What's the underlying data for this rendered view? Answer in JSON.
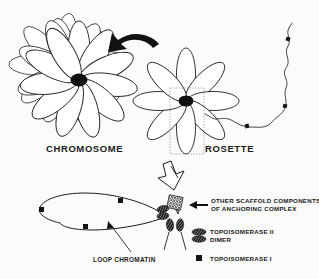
{
  "figure": {
    "title_context": "Chromatin loop organization diagram",
    "background_color": "#fbfbfb",
    "ink_color": "#1a1a1a"
  },
  "labels": {
    "chromosome": "CHROMOSOME",
    "rosette": "ROSETTE",
    "loop_chromatin": "LOOP CHROMATIN",
    "scaffold_line1": "OTHER SCAFFOLD COMPONENTS",
    "scaffold_line2": "OF ANCHORING COMPLEX"
  },
  "legend": {
    "items": [
      {
        "symbol": "hatched-ellipse-pair",
        "line1": "TOPOISOMERASE II",
        "line2": "DIMER"
      },
      {
        "symbol": "filled-square",
        "line1": "TOPOISOMERASE I",
        "line2": ""
      }
    ]
  },
  "icons": {
    "curved_arrow": "curved-arrow-icon",
    "hollow_arrow": "hollow-down-arrow-icon",
    "callout_arrow": "left-pointing-arrow-icon",
    "loop_pointer": "loop-pointer-arrow-icon",
    "selection_box": "dotted-selection-box-icon"
  },
  "structures": {
    "chromosome_rosette_petals": 13,
    "single_rosette_petals": 8,
    "topo1_markers_on_fiber": 3,
    "topo1_markers_on_loop": 3,
    "topo2_dimers": 4
  }
}
